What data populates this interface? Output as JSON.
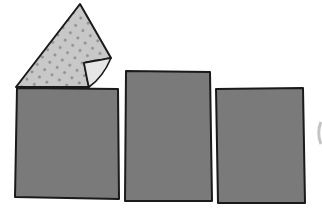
{
  "scene": {
    "description": "Illustration of three dark grey rectangular panels with a dotted light grey sheet peeling off the top of the left panel",
    "colors": {
      "background": "#ffffff",
      "panel_fill": "#7a7a7a",
      "outline": "#1a1a1a",
      "sheet_fill": "#c8c8c8",
      "sheet_dots": "#8e8e8e",
      "curl_fill": "#e6e6e6",
      "edge_mark": "#c4c4c4"
    },
    "panels": [
      {
        "id": "left",
        "x": 16,
        "y": 88,
        "w": 103,
        "h": 112
      },
      {
        "id": "middle",
        "x": 125,
        "y": 71,
        "w": 87,
        "h": 131
      },
      {
        "id": "right",
        "x": 216,
        "y": 89,
        "w": 88,
        "h": 113
      }
    ],
    "peeling_sheet": {
      "tip": [
        80,
        4
      ],
      "base_left": [
        16,
        87
      ],
      "base_right": [
        88,
        87
      ],
      "corner": [
        111,
        58
      ]
    }
  }
}
